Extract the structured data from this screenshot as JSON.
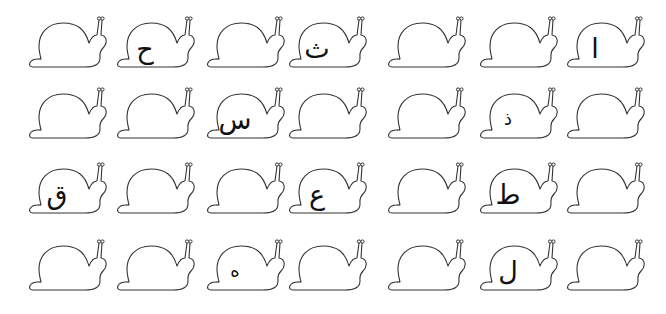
{
  "worksheet": {
    "rows": [
      {
        "snails": [
          {
            "letter": ""
          },
          {
            "letter": "ح"
          },
          {
            "letter": ""
          },
          {
            "letter": "ث"
          },
          {
            "letter": ""
          },
          {
            "letter": ""
          },
          {
            "letter": "ا"
          }
        ]
      },
      {
        "snails": [
          {
            "letter": ""
          },
          {
            "letter": ""
          },
          {
            "letter": "س"
          },
          {
            "letter": ""
          },
          {
            "letter": ""
          },
          {
            "letter": "ذ"
          },
          {
            "letter": ""
          }
        ]
      },
      {
        "snails": [
          {
            "letter": "ق"
          },
          {
            "letter": ""
          },
          {
            "letter": ""
          },
          {
            "letter": "ع"
          },
          {
            "letter": ""
          },
          {
            "letter": "ط"
          },
          {
            "letter": ""
          }
        ]
      },
      {
        "snails": [
          {
            "letter": ""
          },
          {
            "letter": ""
          },
          {
            "letter": "ه"
          },
          {
            "letter": ""
          },
          {
            "letter": ""
          },
          {
            "letter": "ل"
          },
          {
            "letter": ""
          }
        ]
      }
    ],
    "colors": {
      "outline": "#333333",
      "letter": "#111111",
      "background": "#ffffff"
    }
  }
}
